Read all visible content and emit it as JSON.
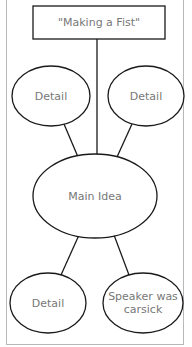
{
  "diagram": {
    "title_box": {
      "label": "\"Making a Fist\""
    },
    "main_idea": {
      "label": "Main Idea"
    },
    "details": [
      {
        "label": "Detail"
      },
      {
        "label": "Detail"
      },
      {
        "label": "Detail"
      },
      {
        "label": "Speaker was carsick"
      }
    ]
  },
  "colors": {
    "stroke": "#1a1a1a",
    "text": "#777777",
    "frame": "#b8b8b8"
  }
}
